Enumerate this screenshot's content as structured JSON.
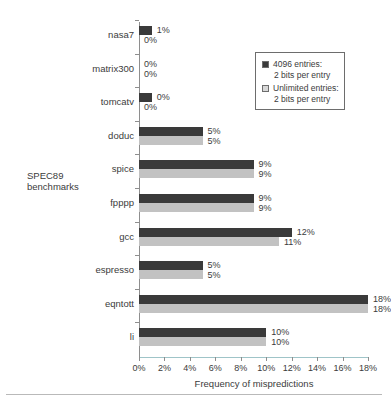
{
  "chart_data": {
    "type": "bar",
    "orientation": "horizontal",
    "title": "",
    "xlabel": "Frequency of mispredictions",
    "ylabel": "SPEC89 benchmarks",
    "xlim": [
      0,
      18
    ],
    "xticks": [
      "0%",
      "2%",
      "4%",
      "6%",
      "8%",
      "10%",
      "12%",
      "14%",
      "16%",
      "18%"
    ],
    "xtick_values": [
      0,
      2,
      4,
      6,
      8,
      10,
      12,
      14,
      16,
      18
    ],
    "grid": false,
    "legend_position": "top-right",
    "categories": [
      "nasa7",
      "matrix300",
      "tomcatv",
      "doduc",
      "spice",
      "fpppp",
      "gcc",
      "espresso",
      "eqntott",
      "li"
    ],
    "series": [
      {
        "name": "4096 entries: 2 bits per entry",
        "color": "#3a3a3a",
        "values": [
          1,
          0,
          1,
          5,
          9,
          9,
          12,
          5,
          18,
          10
        ],
        "labels": [
          "1%",
          "0%",
          "0%",
          "5%",
          "9%",
          "9%",
          "12%",
          "5%",
          "18%",
          "10%"
        ]
      },
      {
        "name": "Unlimited entries: 2 bits per entry",
        "color": "#c2c2c2",
        "values": [
          0,
          0,
          0,
          5,
          9,
          9,
          11,
          5,
          18,
          10
        ],
        "labels": [
          "0%",
          "0%",
          "0%",
          "5%",
          "9%",
          "9%",
          "11%",
          "5%",
          "18%",
          "10%"
        ]
      }
    ]
  },
  "legend": {
    "entries": [
      {
        "line1": "4096 entries:",
        "line2": "2 bits per entry",
        "swatch_color": "#3a3a3a"
      },
      {
        "line1": "Unlimited entries:",
        "line2": "2 bits per entry",
        "swatch_color": "#d8d8d8"
      }
    ]
  },
  "axes": {
    "x_title": "Frequency of mispredictions",
    "y_title_line1": "SPEC89",
    "y_title_line2": "benchmarks"
  }
}
